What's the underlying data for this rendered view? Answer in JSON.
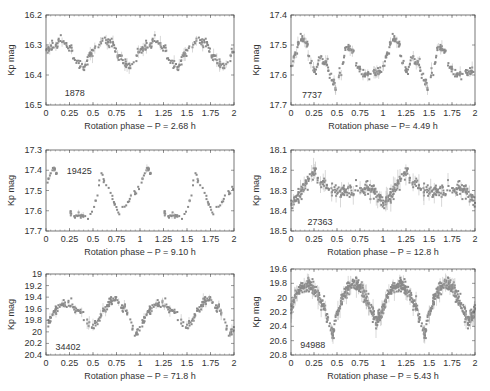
{
  "figure": {
    "point_color": "#8a8a8a",
    "axis_color": "#555555",
    "text_color": "#333333"
  },
  "chart_data": [
    {
      "type": "scatter",
      "id": "1878",
      "label": "1878",
      "xlabel": "Rotation phase – P = 2.68 h",
      "ylabel": "Kp mag",
      "xlim": [
        0,
        2
      ],
      "ylim": [
        16.2,
        16.5
      ],
      "ylim_inverted": true,
      "xticks": [
        "0",
        "0.25",
        "0.5",
        "0.75",
        "1",
        "1.25",
        "1.5",
        "1.75",
        "2"
      ],
      "yticks": [
        "16.2",
        "16.3",
        "16.4",
        "16.5"
      ],
      "label_pos": [
        0.2,
        16.46
      ],
      "frame": [
        46,
        15,
        234,
        105
      ],
      "curve": [
        [
          0,
          16.32
        ],
        [
          0.08,
          16.3
        ],
        [
          0.17,
          16.285
        ],
        [
          0.25,
          16.31
        ],
        [
          0.33,
          16.36
        ],
        [
          0.4,
          16.375
        ],
        [
          0.47,
          16.33
        ],
        [
          0.55,
          16.305
        ],
        [
          0.62,
          16.285
        ],
        [
          0.7,
          16.3
        ],
        [
          0.78,
          16.34
        ],
        [
          0.87,
          16.37
        ],
        [
          0.93,
          16.36
        ],
        [
          1.0,
          16.32
        ]
      ],
      "noise": 0.008,
      "n_points": 150
    },
    {
      "type": "scatter",
      "id": "7737",
      "label": "7737",
      "xlabel": "Rotation phase – P= 4.49 h",
      "ylabel": "Kp mag",
      "xlim": [
        0,
        2
      ],
      "ylim": [
        17.4,
        17.7
      ],
      "ylim_inverted": true,
      "xticks": [
        "0",
        "0.25",
        "0.5",
        "0.75",
        "1",
        "1.25",
        "1.5",
        "1.75",
        "2"
      ],
      "yticks": [
        "17.4",
        "17.5",
        "17.6",
        "17.7"
      ],
      "label_pos": [
        0.12,
        17.665
      ],
      "frame": [
        291,
        15,
        475,
        105
      ],
      "curve": [
        [
          0,
          17.57
        ],
        [
          0.05,
          17.53
        ],
        [
          0.1,
          17.475
        ],
        [
          0.16,
          17.49
        ],
        [
          0.22,
          17.56
        ],
        [
          0.26,
          17.585
        ],
        [
          0.32,
          17.54
        ],
        [
          0.38,
          17.56
        ],
        [
          0.44,
          17.61
        ],
        [
          0.49,
          17.645
        ],
        [
          0.54,
          17.59
        ],
        [
          0.6,
          17.505
        ],
        [
          0.66,
          17.52
        ],
        [
          0.72,
          17.57
        ],
        [
          0.78,
          17.6
        ],
        [
          0.84,
          17.595
        ],
        [
          0.92,
          17.59
        ],
        [
          0.98,
          17.585
        ],
        [
          1.0,
          17.57
        ]
      ],
      "noise": 0.007,
      "n_points": 170
    },
    {
      "type": "scatter",
      "id": "19425",
      "label": "19425",
      "xlabel": "Rotation phase – P = 9.10 h",
      "ylabel": "Kp mag",
      "xlim": [
        0,
        2
      ],
      "ylim": [
        17.3,
        17.7
      ],
      "ylim_inverted": true,
      "xticks": [
        "0",
        "0.25",
        "0.5",
        "0.75",
        "1",
        "1.25",
        "1.5",
        "1.75",
        "2"
      ],
      "yticks": [
        "17.3",
        "17.4",
        "17.5",
        "17.6",
        "17.7"
      ],
      "label_pos": [
        0.22,
        17.405
      ],
      "frame": [
        46,
        150,
        234,
        231
      ],
      "curve": [
        [
          0,
          17.48
        ],
        [
          0.04,
          17.42
        ],
        [
          0.08,
          17.39
        ],
        [
          0.13,
          17.43
        ],
        [
          0.18,
          17.52
        ],
        [
          0.23,
          17.6
        ],
        [
          0.3,
          17.625
        ],
        [
          0.38,
          17.62
        ],
        [
          0.45,
          17.64
        ],
        [
          0.5,
          17.6
        ],
        [
          0.55,
          17.52
        ],
        [
          0.58,
          17.4
        ],
        [
          0.62,
          17.46
        ],
        [
          0.66,
          17.48
        ],
        [
          0.7,
          17.53
        ],
        [
          0.74,
          17.58
        ],
        [
          0.78,
          17.615
        ],
        [
          0.85,
          17.58
        ],
        [
          0.92,
          17.52
        ],
        [
          1.0,
          17.48
        ]
      ],
      "noise": 0.006,
      "n_points": 80
    },
    {
      "type": "scatter",
      "id": "27363",
      "label": "27363",
      "xlabel": "Rotation phase – P = 12.8 h",
      "ylabel": "Kp mag",
      "xlim": [
        0,
        2
      ],
      "ylim": [
        18.1,
        18.5
      ],
      "ylim_inverted": true,
      "xticks": [
        "0",
        "0.25",
        "0.5",
        "0.75",
        "1",
        "1.25",
        "1.5",
        "1.75",
        "2"
      ],
      "yticks": [
        "18.1",
        "18.2",
        "18.3",
        "18.4",
        "18.5"
      ],
      "label_pos": [
        0.18,
        18.455
      ],
      "frame": [
        291,
        150,
        475,
        231
      ],
      "curve": [
        [
          0,
          18.35
        ],
        [
          0.06,
          18.34
        ],
        [
          0.12,
          18.3
        ],
        [
          0.18,
          18.24
        ],
        [
          0.25,
          18.21
        ],
        [
          0.32,
          18.24
        ],
        [
          0.4,
          18.29
        ],
        [
          0.5,
          18.3
        ],
        [
          0.6,
          18.3
        ],
        [
          0.7,
          18.3
        ],
        [
          0.8,
          18.29
        ],
        [
          0.88,
          18.3
        ],
        [
          0.95,
          18.33
        ],
        [
          1.0,
          18.35
        ]
      ],
      "noise": 0.018,
      "n_points": 220
    },
    {
      "type": "scatter",
      "id": "34402",
      "label": "34402",
      "xlabel": "Rotation phase – P = 71.8 h",
      "ylabel": "Kp mag",
      "xlim": [
        0,
        2
      ],
      "ylim": [
        19.0,
        20.4
      ],
      "ylim_inverted": true,
      "xticks": [
        "0",
        "0.25",
        "0.5",
        "0.75",
        "1",
        "1.25",
        "1.5",
        "1.75",
        "2"
      ],
      "yticks": [
        "19",
        "19.2",
        "19.4",
        "19.6",
        "19.8",
        "20",
        "20.2",
        "20.4"
      ],
      "label_pos": [
        0.1,
        20.26
      ],
      "frame": [
        46,
        274,
        234,
        355
      ],
      "curve": [
        [
          0,
          19.9
        ],
        [
          0.05,
          19.78
        ],
        [
          0.1,
          19.62
        ],
        [
          0.18,
          19.52
        ],
        [
          0.26,
          19.53
        ],
        [
          0.33,
          19.62
        ],
        [
          0.38,
          19.68
        ],
        [
          0.42,
          19.78
        ],
        [
          0.47,
          19.9
        ],
        [
          0.5,
          19.95
        ],
        [
          0.55,
          19.82
        ],
        [
          0.62,
          19.62
        ],
        [
          0.68,
          19.5
        ],
        [
          0.74,
          19.42
        ],
        [
          0.78,
          19.45
        ],
        [
          0.8,
          19.6
        ],
        [
          0.84,
          19.55
        ],
        [
          0.88,
          19.72
        ],
        [
          0.92,
          19.9
        ],
        [
          0.95,
          20.05
        ],
        [
          1.0,
          19.9
        ]
      ],
      "noise": 0.035,
      "n_points": 160
    },
    {
      "type": "scatter",
      "id": "94988",
      "label": "94988",
      "xlabel": "Rotation phase – P = 5.43 h",
      "ylabel": "Kp mag",
      "xlim": [
        0,
        2
      ],
      "ylim": [
        19.6,
        20.8
      ],
      "ylim_inverted": true,
      "xticks": [
        "0",
        "0.25",
        "0.5",
        "0.75",
        "1",
        "1.25",
        "1.5",
        "1.75",
        "2"
      ],
      "yticks": [
        "19.6",
        "19.8",
        "20",
        "20.2",
        "20.4",
        "20.6",
        "20.8"
      ],
      "label_pos": [
        0.1,
        20.66
      ],
      "frame": [
        291,
        269,
        475,
        355
      ],
      "curve": [
        [
          0,
          20.15
        ],
        [
          0.06,
          19.95
        ],
        [
          0.12,
          19.85
        ],
        [
          0.2,
          19.82
        ],
        [
          0.28,
          19.92
        ],
        [
          0.35,
          20.1
        ],
        [
          0.41,
          20.32
        ],
        [
          0.45,
          20.5
        ],
        [
          0.5,
          20.25
        ],
        [
          0.56,
          20.0
        ],
        [
          0.62,
          19.86
        ],
        [
          0.68,
          19.8
        ],
        [
          0.75,
          19.86
        ],
        [
          0.82,
          20.0
        ],
        [
          0.88,
          20.2
        ],
        [
          0.93,
          20.32
        ],
        [
          0.97,
          20.25
        ],
        [
          1.0,
          20.15
        ]
      ],
      "noise": 0.045,
      "n_points": 420
    }
  ]
}
